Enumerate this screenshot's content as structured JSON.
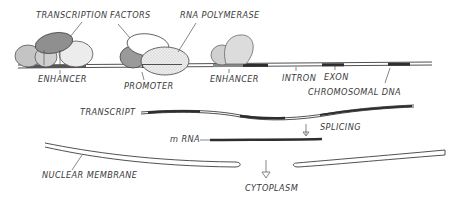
{
  "diagram": {
    "labels": {
      "transcription": "TRANSCRIPTION",
      "factors": "FACTORS",
      "rna_polymerase": "RNA POLYMERASE",
      "enhancer_left": "ENHANCER",
      "promoter": "PROMOTER",
      "enhancer_right": "ENHANCER",
      "intron": "INTRON",
      "exon": "EXON",
      "chromosomal_dna": "CHROMOSOMAL DNA",
      "transcript": "TRANSCRIPT",
      "splicing": "SPLICING",
      "mrna": "m RNA",
      "nuclear_membrane": "NUCLEAR MEMBRANE",
      "cytoplasm": "CYTOPLASM"
    },
    "colors": {
      "ink": "#3d3d3d",
      "protein_dark": "#9a9a9a",
      "protein_mid": "#c4c4c4",
      "protein_light": "#dedede",
      "exon_band": "#2e2e2e",
      "background": "#ffffff"
    }
  }
}
